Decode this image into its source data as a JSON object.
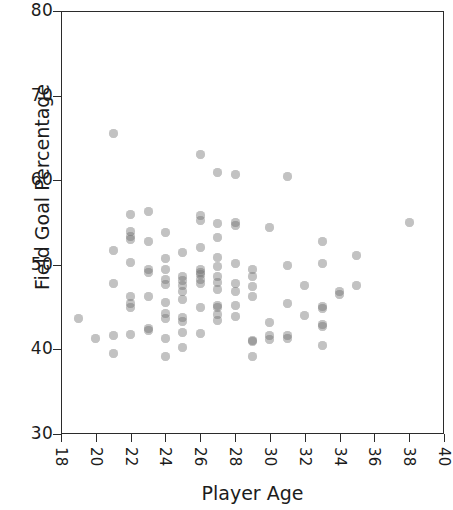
{
  "chart_data": {
    "type": "scatter",
    "title": "",
    "xlabel": "Player Age",
    "ylabel": "Field Goal Percentage",
    "xlim": [
      18,
      40
    ],
    "ylim": [
      30,
      80
    ],
    "xticks": [
      18,
      20,
      22,
      24,
      26,
      28,
      30,
      32,
      34,
      36,
      38,
      40
    ],
    "yticks": [
      30,
      40,
      50,
      60,
      70,
      80
    ],
    "xtick_labels": [
      "18",
      "20",
      "22",
      "24",
      "26",
      "28",
      "30",
      "32",
      "34",
      "36",
      "38",
      "40"
    ],
    "ytick_labels": [
      "30",
      "40",
      "50",
      "60",
      "70",
      "80"
    ],
    "xtick_label_rotation": 90,
    "grid": false,
    "legend": null,
    "marker": {
      "shape": "circle",
      "color": "#6e6e6e",
      "opacity": 0.42,
      "size_px": 9
    },
    "series": [
      {
        "name": "NBA players",
        "points": [
          [
            19.0,
            43.6
          ],
          [
            20.0,
            41.3
          ],
          [
            21.0,
            65.5
          ],
          [
            21.0,
            51.7
          ],
          [
            21.0,
            47.8
          ],
          [
            21.0,
            41.7
          ],
          [
            21.0,
            39.5
          ],
          [
            22.0,
            56.0
          ],
          [
            22.0,
            53.9
          ],
          [
            22.0,
            53.4
          ],
          [
            22.0,
            53.0
          ],
          [
            22.0,
            50.3
          ],
          [
            22.0,
            46.3
          ],
          [
            22.0,
            45.4
          ],
          [
            22.0,
            44.9
          ],
          [
            22.0,
            41.8
          ],
          [
            23.0,
            56.3
          ],
          [
            23.0,
            52.8
          ],
          [
            23.0,
            49.5
          ],
          [
            23.0,
            49.1
          ],
          [
            23.0,
            46.3
          ],
          [
            23.0,
            42.5
          ],
          [
            23.0,
            42.2
          ],
          [
            24.0,
            53.8
          ],
          [
            24.0,
            50.7
          ],
          [
            24.0,
            49.4
          ],
          [
            24.0,
            48.3
          ],
          [
            24.0,
            47.7
          ],
          [
            24.0,
            45.5
          ],
          [
            24.0,
            44.3
          ],
          [
            24.0,
            43.6
          ],
          [
            24.0,
            41.3
          ],
          [
            24.0,
            39.2
          ],
          [
            25.0,
            51.5
          ],
          [
            25.0,
            48.6
          ],
          [
            25.0,
            48.2
          ],
          [
            25.0,
            47.6
          ],
          [
            25.0,
            46.9
          ],
          [
            25.0,
            45.9
          ],
          [
            25.0,
            43.8
          ],
          [
            25.0,
            43.3
          ],
          [
            25.0,
            42.0
          ],
          [
            25.0,
            40.2
          ],
          [
            26.0,
            63.0
          ],
          [
            26.0,
            55.8
          ],
          [
            26.0,
            55.2
          ],
          [
            26.0,
            52.1
          ],
          [
            26.0,
            49.5
          ],
          [
            26.0,
            49.1
          ],
          [
            26.0,
            48.8
          ],
          [
            26.0,
            48.3
          ],
          [
            26.0,
            47.8
          ],
          [
            26.0,
            44.9
          ],
          [
            26.0,
            41.9
          ],
          [
            27.0,
            60.9
          ],
          [
            27.0,
            54.9
          ],
          [
            27.0,
            53.2
          ],
          [
            27.0,
            50.9
          ],
          [
            27.0,
            49.8
          ],
          [
            27.0,
            48.6
          ],
          [
            27.0,
            47.9
          ],
          [
            27.0,
            47.1
          ],
          [
            27.0,
            45.2
          ],
          [
            27.0,
            44.9
          ],
          [
            27.0,
            44.1
          ],
          [
            27.0,
            43.4
          ],
          [
            28.0,
            60.7
          ],
          [
            28.0,
            55.0
          ],
          [
            28.0,
            54.6
          ],
          [
            28.0,
            50.2
          ],
          [
            28.0,
            47.8
          ],
          [
            28.0,
            46.9
          ],
          [
            28.0,
            45.2
          ],
          [
            28.0,
            43.9
          ],
          [
            29.0,
            49.5
          ],
          [
            29.0,
            48.6
          ],
          [
            29.0,
            47.4
          ],
          [
            29.0,
            46.3
          ],
          [
            29.0,
            41.1
          ],
          [
            29.0,
            40.9
          ],
          [
            29.0,
            39.2
          ],
          [
            30.0,
            54.4
          ],
          [
            30.0,
            43.2
          ],
          [
            30.0,
            41.7
          ],
          [
            30.0,
            41.2
          ],
          [
            31.0,
            60.4
          ],
          [
            31.0,
            49.9
          ],
          [
            31.0,
            45.4
          ],
          [
            31.0,
            41.6
          ],
          [
            31.0,
            41.3
          ],
          [
            32.0,
            47.6
          ],
          [
            32.0,
            44.0
          ],
          [
            33.0,
            52.8
          ],
          [
            33.0,
            50.2
          ],
          [
            33.0,
            45.1
          ],
          [
            33.0,
            44.8
          ],
          [
            33.0,
            43.0
          ],
          [
            33.0,
            42.7
          ],
          [
            33.0,
            40.5
          ],
          [
            34.0,
            46.8
          ],
          [
            34.0,
            46.5
          ],
          [
            35.0,
            51.1
          ],
          [
            35.0,
            47.5
          ],
          [
            38.0,
            55.0
          ]
        ]
      }
    ]
  }
}
